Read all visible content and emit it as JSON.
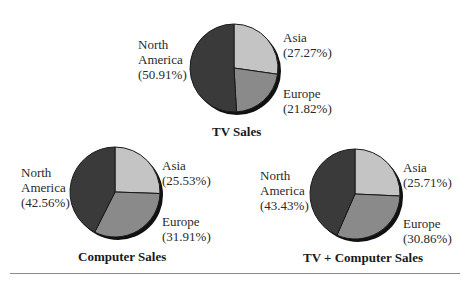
{
  "chart_data": [
    {
      "type": "pie",
      "title": "TV Sales",
      "categories": [
        "North America",
        "Asia",
        "Europe"
      ],
      "values": [
        50.91,
        27.27,
        21.82
      ],
      "labels": [
        "North America (50.91%)",
        "Asia (27.27%)",
        "Europe (21.82%)"
      ]
    },
    {
      "type": "pie",
      "title": "Computer Sales",
      "categories": [
        "North America",
        "Asia",
        "Europe"
      ],
      "values": [
        42.56,
        25.53,
        31.91
      ],
      "labels": [
        "North America (42.56%)",
        "Asia (25.53%)",
        "Europe (31.91%)"
      ]
    },
    {
      "type": "pie",
      "title": "TV + Computer Sales",
      "categories": [
        "North America",
        "Asia",
        "Europe"
      ],
      "values": [
        43.43,
        25.71,
        30.86
      ],
      "labels": [
        "North America (43.43%)",
        "Asia (25.71%)",
        "Europe (30.86%)"
      ]
    }
  ],
  "colors": {
    "north_america": "#3a3a3a",
    "asia": "#c4c4c4",
    "europe": "#8a8a8a",
    "shadow": "#111111",
    "outline": "#1a1a1a"
  },
  "charts": {
    "tv": {
      "title": "TV Sales",
      "na_label": "North\nAmerica\n(50.91%)",
      "asia_label": "Asia\n(27.27%)",
      "europe_label": "Europe\n(21.82%)"
    },
    "computer": {
      "title": "Computer Sales",
      "na_label": "North\nAmerica\n(42.56%)",
      "asia_label": "Asia\n(25.53%)",
      "europe_label": "Europe\n(31.91%)"
    },
    "combined": {
      "title": "TV + Computer Sales",
      "na_label": "North\nAmerica\n(43.43%)",
      "asia_label": "Asia\n(25.71%)",
      "europe_label": "Europe\n(30.86%)"
    }
  }
}
